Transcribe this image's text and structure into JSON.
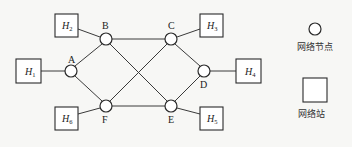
{
  "diagram": {
    "type": "network-topology",
    "nodes": [
      {
        "id": "A",
        "label": "A"
      },
      {
        "id": "B",
        "label": "B"
      },
      {
        "id": "C",
        "label": "C"
      },
      {
        "id": "D",
        "label": "D"
      },
      {
        "id": "E",
        "label": "E"
      },
      {
        "id": "F",
        "label": "F"
      }
    ],
    "hosts": [
      {
        "id": "H1",
        "letter": "H",
        "sub": "1"
      },
      {
        "id": "H2",
        "letter": "H",
        "sub": "2"
      },
      {
        "id": "H3",
        "letter": "H",
        "sub": "3"
      },
      {
        "id": "H4",
        "letter": "H",
        "sub": "4"
      },
      {
        "id": "H5",
        "letter": "H",
        "sub": "5"
      },
      {
        "id": "H6",
        "letter": "H",
        "sub": "6"
      }
    ],
    "edges": [
      [
        "H1",
        "A"
      ],
      [
        "H2",
        "B"
      ],
      [
        "H6",
        "F"
      ],
      [
        "H3",
        "C"
      ],
      [
        "H5",
        "E"
      ],
      [
        "H4",
        "D"
      ],
      [
        "A",
        "B"
      ],
      [
        "A",
        "F"
      ],
      [
        "B",
        "C"
      ],
      [
        "B",
        "E"
      ],
      [
        "F",
        "C"
      ],
      [
        "F",
        "E"
      ],
      [
        "C",
        "D"
      ],
      [
        "E",
        "D"
      ]
    ]
  },
  "legend": {
    "node_label": "网络节点",
    "host_label": "网络站"
  }
}
